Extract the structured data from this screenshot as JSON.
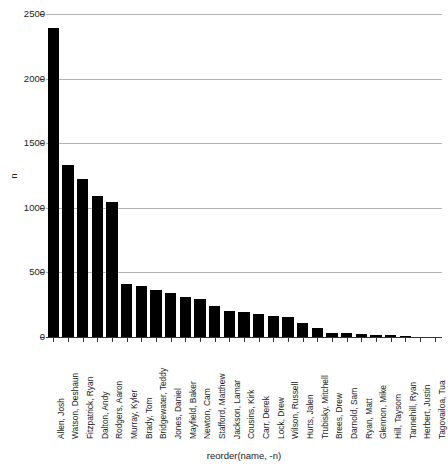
{
  "chart_data": {
    "type": "bar",
    "title": "",
    "subtitle": "",
    "xlabel": "reorder(name, -n)",
    "ylabel": "n",
    "ylim": [
      0,
      2500
    ],
    "yticks": [
      0,
      500,
      1000,
      1500,
      2000,
      2500
    ],
    "ytick_labels": [
      "0",
      "500",
      "1000",
      "1500",
      "2000",
      "2500"
    ],
    "grid": "horizontal-major-only",
    "legend": "none",
    "bar_color": "#000000",
    "grid_color": "#b4b4b4",
    "axis_color": "#333333",
    "categories": [
      "Allen, Josh",
      "Watson, Deshaun",
      "Fitzpatrick, Ryan",
      "Dalton, Andy",
      "Rodgers, Aaron",
      "Murray, Kyler",
      "Brady, Tom",
      "Bridgewater, Teddy",
      "Jones, Daniel",
      "Mayfield, Baker",
      "Newton, Cam",
      "Stafford, Matthew",
      "Jackson, Lamar",
      "Cousins, Kirk",
      "Carr, Derek",
      "Lock, Drew",
      "Wilson, Russell",
      "Hurts, Jalen",
      "Trubisky, Mitchell",
      "Brees, Drew",
      "Darnold, Sam",
      "Ryan, Matt",
      "Glennon, Mike",
      "Hill, Taysom",
      "Tannehill, Ryan",
      "Herbert, Justin",
      "Tagovailoa, Tua"
    ],
    "values": [
      2400,
      1340,
      1230,
      1100,
      1050,
      415,
      400,
      370,
      345,
      320,
      300,
      250,
      210,
      205,
      185,
      170,
      160,
      120,
      80,
      40,
      35,
      30,
      25,
      20,
      15,
      10,
      5
    ]
  }
}
